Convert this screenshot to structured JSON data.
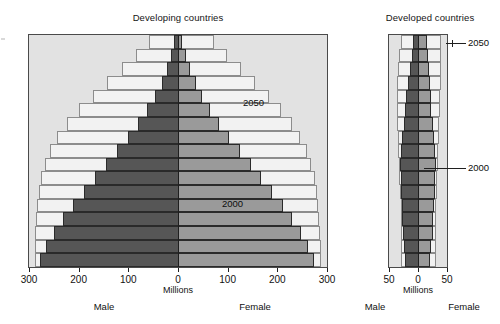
{
  "figure": {
    "units_label": "Millions",
    "male_label": "Male",
    "female_label": "Female",
    "series_2000_label": "2000",
    "series_2050_label": "2050",
    "colors": {
      "male_2000": "#565656",
      "female_2000": "#9a9a9a",
      "envelope_2050_fill": "#f2f2f2",
      "plot_background": "#e2e2e2",
      "axis": "#1f1f1f"
    }
  },
  "chart_data": [
    {
      "type": "bar",
      "title": "Developing countries",
      "subtype": "population-pyramid",
      "xlabel": "Millions",
      "ylabel": "",
      "xlim": [
        -300,
        300
      ],
      "xticks": [
        -300,
        -200,
        -100,
        0,
        100,
        200,
        300
      ],
      "xtick_labels": [
        "300",
        "200",
        "100",
        "0",
        "100",
        "200",
        "300"
      ],
      "grid": false,
      "legend_position": "inline-annotation",
      "categories": [
        "80+",
        "75-79",
        "70-74",
        "65-69",
        "60-64",
        "55-59",
        "50-54",
        "45-49",
        "40-44",
        "35-39",
        "30-34",
        "25-29",
        "20-24",
        "15-19",
        "10-14",
        "5-9",
        "0-4"
      ],
      "series": [
        {
          "name": "2000 Male",
          "side": "left",
          "values": [
            8,
            14,
            22,
            33,
            46,
            62,
            80,
            100,
            122,
            145,
            168,
            190,
            212,
            232,
            250,
            266,
            278
          ]
        },
        {
          "name": "2000 Female",
          "side": "right",
          "values": [
            9,
            16,
            25,
            36,
            49,
            65,
            83,
            103,
            124,
            146,
            168,
            190,
            211,
            230,
            247,
            262,
            274
          ]
        },
        {
          "name": "2050 Male",
          "side": "left",
          "values": [
            58,
            84,
            112,
            142,
            172,
            200,
            224,
            243,
            258,
            268,
            275,
            280,
            283,
            285,
            287,
            288,
            288
          ]
        },
        {
          "name": "2050 Female",
          "side": "right",
          "values": [
            72,
            98,
            126,
            155,
            183,
            208,
            229,
            246,
            259,
            268,
            275,
            279,
            282,
            284,
            286,
            287,
            287
          ]
        }
      ]
    },
    {
      "type": "bar",
      "title": "Developed countries",
      "subtype": "population-pyramid",
      "xlabel": "Millions",
      "ylabel": "",
      "xlim": [
        -50,
        50
      ],
      "xticks": [
        -50,
        0,
        50
      ],
      "xtick_labels": [
        "50",
        "0",
        "50"
      ],
      "grid": false,
      "legend_position": "leader-lines",
      "categories": [
        "80+",
        "75-79",
        "70-74",
        "65-69",
        "60-64",
        "55-59",
        "50-54",
        "45-49",
        "40-44",
        "35-39",
        "30-34",
        "25-29",
        "20-24",
        "15-19",
        "10-14",
        "5-9",
        "0-4"
      ],
      "series": [
        {
          "name": "2000 Male",
          "side": "left",
          "values": [
            9,
            11,
            14,
            17,
            20,
            22,
            25,
            28,
            30,
            31,
            30,
            29,
            28,
            27,
            26,
            24,
            22
          ]
        },
        {
          "name": "2000 Female",
          "side": "right",
          "values": [
            16,
            17,
            19,
            20,
            22,
            23,
            26,
            28,
            30,
            31,
            30,
            29,
            27,
            26,
            25,
            23,
            21
          ]
        },
        {
          "name": "2050 Male",
          "side": "left",
          "values": [
            30,
            33,
            35,
            36,
            37,
            37,
            36,
            35,
            34,
            33,
            32,
            31,
            30,
            30,
            30,
            30,
            30
          ]
        },
        {
          "name": "2050 Female",
          "side": "right",
          "values": [
            39,
            39,
            39,
            39,
            38,
            38,
            37,
            36,
            35,
            34,
            33,
            32,
            31,
            31,
            31,
            31,
            31
          ]
        }
      ]
    }
  ]
}
